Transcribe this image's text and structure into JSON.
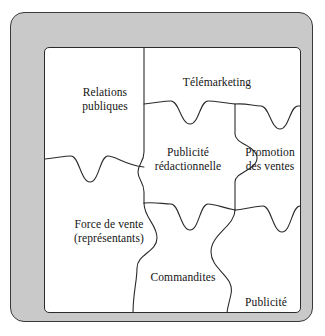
{
  "diagram": {
    "type": "jigsaw-puzzle",
    "title": "",
    "frame": {
      "border_color": "#3a3a3a",
      "fill_color": "#c9c9c9"
    },
    "panel": {
      "border_color": "#2b2b2b",
      "fill_color": "#ffffff"
    },
    "piece_stroke_color": "#2b2b2b",
    "pieces": [
      {
        "id": "relations-publiques",
        "label": "Relations\npubliques",
        "position": "top-left"
      },
      {
        "id": "telemarketing",
        "label": "Télémarketing",
        "position": "top-center"
      },
      {
        "id": "publicite-redac",
        "label": "Publicité\nrédactionnelle",
        "position": "middle-center"
      },
      {
        "id": "promotion-ventes",
        "label": "Promotion\ndes ventes",
        "position": "middle-right"
      },
      {
        "id": "force-de-vente",
        "label": "Force de vente\n(représentants)",
        "position": "bottom-left"
      },
      {
        "id": "commandites",
        "label": "Commandites",
        "position": "bottom-center"
      },
      {
        "id": "publicite",
        "label": "Publicité",
        "position": "bottom-right"
      }
    ]
  }
}
